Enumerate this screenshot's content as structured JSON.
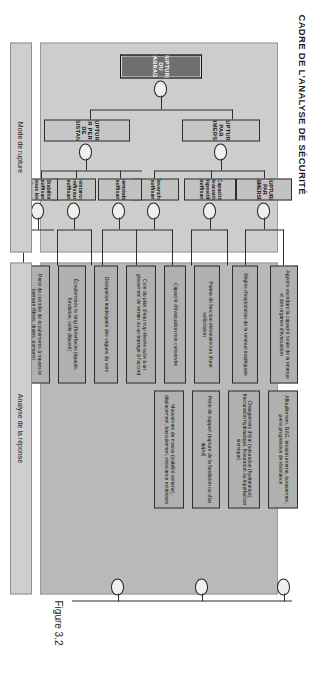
{
  "figure": {
    "title": "CADRE DE L'ANALYSE DE SÉCURITÉ",
    "caption": "Figure 3.2"
  },
  "bands": {
    "mode_label": "Mode de rupture",
    "reponse_label": "Analyse de la réponse"
  },
  "top_event": {
    "label": "RUPTURE DU BARRAGE"
  },
  "level2": [
    {
      "label": "RUPTURE PAR SUBMERSION"
    },
    {
      "label": "RUPTURE PAR PERTE DE RÉSISTANCE"
    }
  ],
  "level3": [
    {
      "label": "RUPTURE PAR SUBMERSION"
    },
    {
      "label": "Capacité d'évacuation dispositifs insuffisante"
    },
    {
      "label": "Revanche insuffisante"
    },
    {
      "label": "Imperméabilité insuffisante"
    },
    {
      "label": "Résistance à l'usure/fissuration insuffisante"
    },
    {
      "label": "Stabilité insuffisante sous les charges appliquées"
    }
  ],
  "leaves": [
    {
      "label": "Apports excédant la capacité totale de la retenue et des organes d'évacuation"
    },
    {
      "label": "Règles d'exploitation de la retenue inadéquate"
    },
    {
      "label": "Panne de fonction élévatoire lors d'une sollicitation"
    },
    {
      "label": "Capacité d'évacuation non conservée"
    },
    {
      "label": "Cote du plan d'eau trop élevée suite à un glissement de terrain ou un barrage à l'accord"
    },
    {
      "label": "Dissipation inadéquate des vagues du vent"
    },
    {
      "label": "Écoulements le long d'interfaces (épaule, fondation, voile déposé)"
    },
    {
      "label": "Perte de contrôle de écoulements à travers le barrage (fibres, drains, pompes)"
    },
    {
      "label": "Affouillement, RAG, érosion interne, écrasement, perte progressive de résistance"
    },
    {
      "label": "Changement d'état (saturation (hydratation), fracturation hydraulique, fissuration ou liquéfaction sismique)"
    },
    {
      "label": "Perte de support (rupture de la fondation ou d'un appui)"
    },
    {
      "label": "Mouvement de masse (stabilité externe), déplacement, basculement, résistance extérieure"
    }
  ],
  "gates": {
    "type": "OR",
    "count": 9
  },
  "colors": {
    "top_event_fill": "#6f6f6f",
    "node_fill": "#c6c6c6",
    "leaf_fill": "#b0b0b0",
    "band_mode_fill": "#cdcdcd",
    "band_reponse_fill": "#b9b9b9",
    "line": "#2f2f2f"
  }
}
